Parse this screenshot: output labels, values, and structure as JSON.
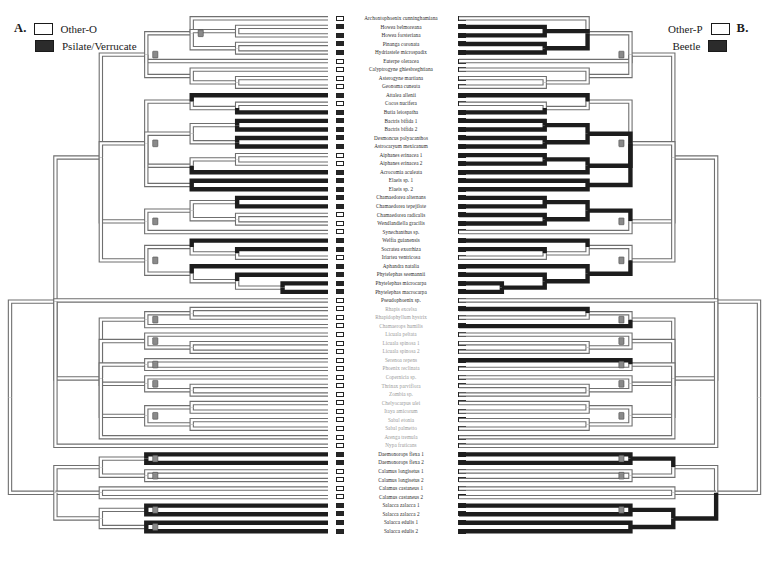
{
  "figure": {
    "panel_a": {
      "letter": "A.",
      "legend": [
        {
          "state": "other-o",
          "label": "Other-O",
          "swatch": "open"
        },
        {
          "state": "psilate-verrucate",
          "label": "Psilate/Verrucate",
          "swatch": "filled"
        }
      ]
    },
    "panel_b": {
      "letter": "B.",
      "legend": [
        {
          "state": "other-p",
          "label": "Other-P",
          "swatch": "open"
        },
        {
          "state": "beetle",
          "label": "Beetle",
          "swatch": "filled"
        }
      ]
    }
  },
  "taxa": [
    {
      "name": "Archontophoenix cunninghamiana",
      "faint": false,
      "a": "open",
      "b": "open"
    },
    {
      "name": "Howea belmoreana",
      "faint": false,
      "a": "filled",
      "b": "filled"
    },
    {
      "name": "Howea forsteriana",
      "faint": false,
      "a": "filled",
      "b": "filled"
    },
    {
      "name": "Pinanga coronata",
      "faint": false,
      "a": "filled",
      "b": "filled"
    },
    {
      "name": "Hydriastele microspadix",
      "faint": false,
      "a": "filled",
      "b": "filled"
    },
    {
      "name": "Euterpe oleracea",
      "faint": false,
      "a": "open",
      "b": "open"
    },
    {
      "name": "Calyptrogyne ghiesbreghtiana",
      "faint": false,
      "a": "open",
      "b": "open"
    },
    {
      "name": "Asterogyne martiana",
      "faint": false,
      "a": "open",
      "b": "open"
    },
    {
      "name": "Geonoma cuneata",
      "faint": false,
      "a": "open",
      "b": "open"
    },
    {
      "name": "Attalea allenii",
      "faint": false,
      "a": "filled",
      "b": "filled"
    },
    {
      "name": "Cocos nucifera",
      "faint": false,
      "a": "open",
      "b": "open"
    },
    {
      "name": "Butia leiospatha",
      "faint": false,
      "a": "filled",
      "b": "filled"
    },
    {
      "name": "Bactris bifida 1",
      "faint": false,
      "a": "filled",
      "b": "filled"
    },
    {
      "name": "Bactris bifida 2",
      "faint": false,
      "a": "filled",
      "b": "filled"
    },
    {
      "name": "Desmoncus polyacanthos",
      "faint": false,
      "a": "filled",
      "b": "filled"
    },
    {
      "name": "Astrocaryum mexicanum",
      "faint": false,
      "a": "filled",
      "b": "filled"
    },
    {
      "name": "Aiphanes erinacea 1",
      "faint": false,
      "a": "open",
      "b": "filled"
    },
    {
      "name": "Aiphanes erinacea 2",
      "faint": false,
      "a": "open",
      "b": "filled"
    },
    {
      "name": "Acrocomia aculeata",
      "faint": false,
      "a": "filled",
      "b": "filled"
    },
    {
      "name": "Elaeis sp. 1",
      "faint": false,
      "a": "filled",
      "b": "filled"
    },
    {
      "name": "Elaeis sp. 2",
      "faint": false,
      "a": "filled",
      "b": "filled"
    },
    {
      "name": "Chamaedorea alternans",
      "faint": false,
      "a": "filled",
      "b": "filled"
    },
    {
      "name": "Chamaedorea tepejilote",
      "faint": false,
      "a": "filled",
      "b": "filled"
    },
    {
      "name": "Chamaedorea radicalis",
      "faint": false,
      "a": "open",
      "b": "filled"
    },
    {
      "name": "Wendlandiella gracilis",
      "faint": false,
      "a": "open",
      "b": "filled"
    },
    {
      "name": "Synechanthus sp.",
      "faint": false,
      "a": "open",
      "b": "open"
    },
    {
      "name": "Welfia guianensis",
      "faint": false,
      "a": "filled",
      "b": "filled"
    },
    {
      "name": "Socratea exorrhiza",
      "faint": false,
      "a": "filled",
      "b": "filled"
    },
    {
      "name": "Iriartea ventricosa",
      "faint": false,
      "a": "open",
      "b": "open"
    },
    {
      "name": "Aphandra natalia",
      "faint": false,
      "a": "filled",
      "b": "filled"
    },
    {
      "name": "Phytelephas seemannii",
      "faint": false,
      "a": "filled",
      "b": "filled"
    },
    {
      "name": "Phytelephas microcarpa",
      "faint": false,
      "a": "filled",
      "b": "filled"
    },
    {
      "name": "Phytelephas macrocarpa",
      "faint": false,
      "a": "filled",
      "b": "filled"
    },
    {
      "name": "Pseudophoenix sp.",
      "faint": false,
      "a": "open",
      "b": "open"
    },
    {
      "name": "Rhapis excelsa",
      "faint": true,
      "a": "open",
      "b": "filled"
    },
    {
      "name": "Rhapidophyllum hystrix",
      "faint": true,
      "a": "open",
      "b": "open"
    },
    {
      "name": "Chamaerops humilis",
      "faint": true,
      "a": "open",
      "b": "filled"
    },
    {
      "name": "Licuala peltata",
      "faint": true,
      "a": "open",
      "b": "open"
    },
    {
      "name": "Licuala spinosa 1",
      "faint": true,
      "a": "open",
      "b": "open"
    },
    {
      "name": "Licuala spinosa 2",
      "faint": true,
      "a": "open",
      "b": "open"
    },
    {
      "name": "Serenoa repens",
      "faint": true,
      "a": "open",
      "b": "filled"
    },
    {
      "name": "Phoenix reclinata",
      "faint": true,
      "a": "open",
      "b": "open"
    },
    {
      "name": "Copernicia sp.",
      "faint": true,
      "a": "open",
      "b": "open"
    },
    {
      "name": "Thrinax parviflora",
      "faint": true,
      "a": "open",
      "b": "open"
    },
    {
      "name": "Zombia sp.",
      "faint": true,
      "a": "open",
      "b": "open"
    },
    {
      "name": "Chelyocarpus ulei",
      "faint": true,
      "a": "open",
      "b": "open"
    },
    {
      "name": "Itaya amicorum",
      "faint": true,
      "a": "open",
      "b": "open"
    },
    {
      "name": "Sabal etonia",
      "faint": true,
      "a": "open",
      "b": "open"
    },
    {
      "name": "Sabal palmetto",
      "faint": true,
      "a": "open",
      "b": "open"
    },
    {
      "name": "Arenga tremula",
      "faint": true,
      "a": "open",
      "b": "open"
    },
    {
      "name": "Nypa fruticans",
      "faint": true,
      "a": "open",
      "b": "open"
    },
    {
      "name": "Daemonorops flexa 1",
      "faint": false,
      "a": "filled",
      "b": "filled"
    },
    {
      "name": "Daemonorops flexa 2",
      "faint": false,
      "a": "filled",
      "b": "filled"
    },
    {
      "name": "Calamus longisetus 1",
      "faint": false,
      "a": "open",
      "b": "open"
    },
    {
      "name": "Calamus longisetus 2",
      "faint": false,
      "a": "open",
      "b": "open"
    },
    {
      "name": "Calamus castaneus 1",
      "faint": false,
      "a": "open",
      "b": "open"
    },
    {
      "name": "Calamus castaneus 2",
      "faint": false,
      "a": "open",
      "b": "open"
    },
    {
      "name": "Salacca zalacca 1",
      "faint": false,
      "a": "filled",
      "b": "filled"
    },
    {
      "name": "Salacca zalacca 2",
      "faint": false,
      "a": "filled",
      "b": "filled"
    },
    {
      "name": "Salacca edulis 1",
      "faint": false,
      "a": "filled",
      "b": "filled"
    },
    {
      "name": "Salacca edulis 2",
      "faint": false,
      "a": "filled",
      "b": "filled"
    }
  ],
  "tree_a": {
    "terminal_black_branches": [
      9,
      11,
      12,
      13,
      14,
      15,
      18,
      19,
      20,
      21,
      22,
      26,
      27,
      29,
      30,
      31,
      32,
      51,
      52,
      57,
      58,
      59,
      60
    ],
    "node_marks": 14
  },
  "tree_b": {
    "black_clades": [
      "areca-cocoseae",
      "chamaedoreeae",
      "iriarteeae-phytelepheae",
      "calamoideae"
    ],
    "node_marks": 12
  }
}
